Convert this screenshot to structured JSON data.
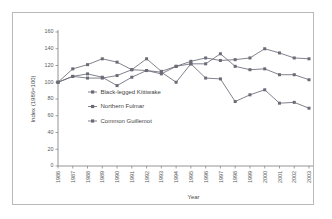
{
  "chart_data": {
    "type": "line",
    "title": "",
    "xlabel": "Year",
    "ylabel": "Index (1986=100)",
    "ylim": [
      0,
      160
    ],
    "yticks": [
      0,
      20,
      40,
      60,
      80,
      100,
      120,
      140,
      160
    ],
    "grid": false,
    "legend_position": "inside-left",
    "categories": [
      "1986",
      "1987",
      "1988",
      "1989",
      "1990",
      "1991",
      "1992",
      "1993",
      "1994",
      "1995",
      "1996",
      "1997",
      "1998",
      "1999",
      "2000",
      "2001",
      "2002",
      "2003"
    ],
    "series": [
      {
        "name": "Black-legged Kittiwake",
        "marker": "square",
        "color": "#6b6b78",
        "values": [
          100,
          107,
          105,
          105,
          108,
          115,
          114,
          110,
          119,
          122,
          105,
          104,
          77,
          85,
          91,
          75,
          76,
          69
        ]
      },
      {
        "name": "Northern Fulmar",
        "marker": "square",
        "color": "#6b6b78",
        "values": [
          100,
          116,
          121,
          128,
          124,
          115,
          128,
          113,
          119,
          125,
          129,
          126,
          127,
          129,
          140,
          135,
          129,
          128
        ]
      },
      {
        "name": "Common Guillemot",
        "marker": "square",
        "color": "#6b6b78",
        "values": [
          100,
          107,
          110,
          106,
          96,
          106,
          114,
          112,
          100,
          122,
          122,
          134,
          119,
          115,
          116,
          109,
          109,
          103
        ]
      }
    ]
  },
  "legend": {
    "items": [
      {
        "label": "Black-legged Kittiwake"
      },
      {
        "label": "Northern Fulmar"
      },
      {
        "label": "Common Guillemot"
      }
    ]
  },
  "colors": {
    "series": "#6b6b78",
    "axis": "#7a7a7a",
    "frame": "#b9b9b9",
    "text": "#4a4a4a",
    "background": "#ffffff"
  }
}
